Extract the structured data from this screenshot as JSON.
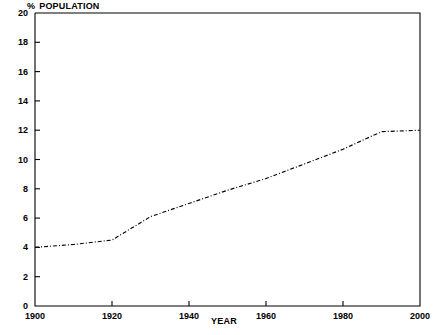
{
  "chart_data": {
    "type": "line",
    "title": "",
    "xlabel": "YEAR",
    "ylabel": "% POPULATION",
    "ylabel_symbol": "%",
    "ylabel_text": "POPULATION",
    "xlim": [
      1900,
      2000
    ],
    "ylim": [
      0,
      20
    ],
    "grid": false,
    "legend": null,
    "line_style": "dash-dot",
    "line_color": "#000000",
    "xticks": [
      1900,
      1920,
      1940,
      1960,
      1980,
      2000
    ],
    "xtick_labels": [
      "1900",
      "1920",
      "1940",
      "1960",
      "1980",
      "2000"
    ],
    "yticks": [
      0,
      2,
      4,
      6,
      8,
      10,
      12,
      14,
      16,
      18,
      20
    ],
    "ytick_labels": [
      "0",
      "2",
      "4",
      "6",
      "8",
      "10",
      "12",
      "14",
      "16",
      "18",
      "20"
    ],
    "series": [
      {
        "name": "% population",
        "x": [
          1900,
          1910,
          1920,
          1925,
          1930,
          1940,
          1950,
          1960,
          1970,
          1980,
          1990,
          2000
        ],
        "values": [
          4.0,
          4.2,
          4.5,
          5.3,
          6.1,
          7.0,
          7.9,
          8.7,
          9.7,
          10.7,
          11.9,
          12.0
        ]
      }
    ]
  }
}
